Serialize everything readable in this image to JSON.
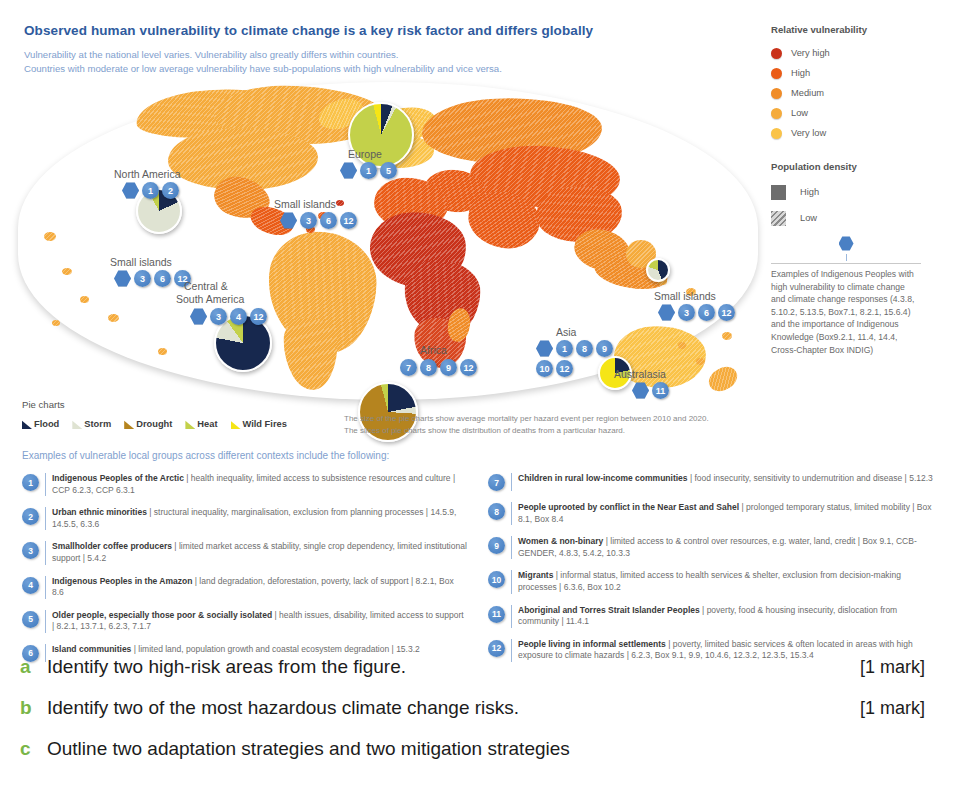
{
  "figure": {
    "title": "Observed human vulnerability to climate change is a key risk factor and differs globally",
    "subtitle_line1": "Vulnerability at the national level varies. Vulnerability also greatly differs within countries.",
    "subtitle_line2": "Countries with moderate or low average vulnerability have sub-populations with high vulnerability and vice versa."
  },
  "legend": {
    "vulnerability_title": "Relative vulnerability",
    "vulnerability_levels": [
      {
        "label": "Very high",
        "color": "#c9321a"
      },
      {
        "label": "High",
        "color": "#ea5c17"
      },
      {
        "label": "Medium",
        "color": "#f08c28"
      },
      {
        "label": "Low",
        "color": "#f5ab3c"
      },
      {
        "label": "Very low",
        "color": "#fac349"
      }
    ],
    "density_title": "Population density",
    "density_levels": [
      {
        "label": "High",
        "style": "solid"
      },
      {
        "label": "Low",
        "style": "hatched"
      }
    ]
  },
  "indigenous_note": {
    "icon": "hex-pin-icon",
    "text": "Examples of Indigenous Peoples with high vulnerability to climate change and climate change responses (4.3.8, 5.10.2, 5.13.5, Box7.1, 8.2.1, 15.6.4) and the importance of Indigenous Knowledge (Box9.2.1, 11.4, 14.4, Cross-Chapter Box INDIG)"
  },
  "pie_legend": {
    "title": "Pie charts",
    "hazards": [
      {
        "label": "Flood",
        "color": "#17284e"
      },
      {
        "label": "Storm",
        "color": "#dfe3d2"
      },
      {
        "label": "Drought",
        "color": "#b5841f"
      },
      {
        "label": "Heat",
        "color": "#c3d14a"
      },
      {
        "label": "Wild Fires",
        "color": "#f5e516"
      }
    ],
    "caption_line1": "The size of the pie charts show average mortality per hazard event per region between 2010 and 2020.",
    "caption_line2": "The slices of pie charts show the distribution of deaths from a particular hazard."
  },
  "map": {
    "regions": [
      {
        "name": "North America",
        "label": "North America",
        "badges": [
          "hex",
          "1",
          "2"
        ],
        "x": 96,
        "y": 86,
        "bx": 104,
        "by": 100
      },
      {
        "name": "Small islands Caribbean",
        "label": "Small islands",
        "badges": [
          "hex",
          "3",
          "6",
          "12"
        ],
        "x": 256,
        "y": 116,
        "bx": 262,
        "by": 130
      },
      {
        "name": "Small islands Pacific East",
        "label": "Small islands",
        "badges": [
          "hex",
          "3",
          "6",
          "12"
        ],
        "x": 92,
        "y": 174,
        "bx": 96,
        "by": 188
      },
      {
        "name": "Central and South America",
        "label": "Central &",
        "label2": "South America",
        "badges": [
          "hex",
          "3",
          "4",
          "12"
        ],
        "x": 166,
        "y": 198,
        "bx": 172,
        "by": 226
      },
      {
        "name": "Europe",
        "label": "Europe",
        "badges": [
          "hex",
          "1",
          "5"
        ],
        "x": 330,
        "y": 66,
        "bx": 322,
        "by": 80
      },
      {
        "name": "Africa",
        "label": "Africa",
        "badges": [
          "7",
          "8",
          "9",
          "12"
        ],
        "x": 402,
        "y": 262,
        "bx": 382,
        "by": 277
      },
      {
        "name": "Asia",
        "label": "Asia",
        "badges": [
          "hex",
          "1",
          "8",
          "9",
          "10",
          "12"
        ],
        "x": 538,
        "y": 244,
        "bx": 518,
        "by": 258
      },
      {
        "name": "Small islands Pacific West",
        "label": "Small islands",
        "badges": [
          "hex",
          "3",
          "6",
          "12"
        ],
        "x": 636,
        "y": 208,
        "bx": 640,
        "by": 222
      },
      {
        "name": "Australasia",
        "label": "Australasia",
        "badges": [
          "hex",
          "11"
        ],
        "x": 596,
        "y": 286,
        "bx": 614,
        "by": 300
      }
    ]
  },
  "chart_data": {
    "type": "pie",
    "hazards": [
      "Flood",
      "Storm",
      "Drought",
      "Heat",
      "Wild Fires"
    ],
    "colors": [
      "#17284e",
      "#dfe3d2",
      "#b5841f",
      "#c3d14a",
      "#f5e516"
    ],
    "pies": [
      {
        "region": "North America",
        "size_px": 46,
        "values": [
          18,
          74,
          0,
          8,
          0
        ]
      },
      {
        "region": "Central & South America",
        "size_px": 58,
        "values": [
          78,
          12,
          0,
          10,
          0
        ]
      },
      {
        "region": "Europe",
        "size_px": 66,
        "values": [
          6,
          2,
          0,
          88,
          4
        ]
      },
      {
        "region": "Africa",
        "size_px": 60,
        "values": [
          22,
          4,
          70,
          4,
          0
        ]
      },
      {
        "region": "Asia",
        "size_px": 24,
        "values": [
          44,
          36,
          0,
          20,
          0
        ]
      },
      {
        "region": "Australasia",
        "size_px": 34,
        "values": [
          22,
          0,
          0,
          10,
          68
        ]
      }
    ]
  },
  "examples": {
    "heading": "Examples of vulnerable local groups across different contexts include the following:",
    "left": [
      {
        "num": "1",
        "title": "Indigenous Peoples of the Arctic",
        "desc": "health inequality, limited access to subsistence resources and culture",
        "refs": "CCP 6.2.3, CCP 6.3.1"
      },
      {
        "num": "2",
        "title": "Urban ethnic minorities",
        "desc": "structural inequality, marginalisation, exclusion from planning processes",
        "refs": "14.5.9, 14.5.5, 6.3.6"
      },
      {
        "num": "3",
        "title": "Smallholder coffee producers",
        "desc": "limited market access & stability, single crop dependency, limited institutional support",
        "refs": "5.4.2"
      },
      {
        "num": "4",
        "title": "Indigenous Peoples in the Amazon",
        "desc": "land degradation, deforestation, poverty, lack of support",
        "refs": "8.2.1, Box 8.6"
      },
      {
        "num": "5",
        "title": "Older people, especially those poor & socially isolated",
        "desc": "health issues, disability, limited access to support",
        "refs": "8.2.1, 13.7.1, 6.2.3, 7.1.7"
      },
      {
        "num": "6",
        "title": "Island communities",
        "desc": "limited land, population growth and coastal ecosystem degradation",
        "refs": "15.3.2"
      }
    ],
    "right": [
      {
        "num": "7",
        "title": "Children in rural low-income communities",
        "desc": "food insecurity, sensitivity to undernutrition and disease",
        "refs": "5.12.3"
      },
      {
        "num": "8",
        "title": "People uprooted by conflict in the Near East and Sahel",
        "desc": "prolonged temporary status, limited mobility",
        "refs": "Box 8.1, Box 8.4"
      },
      {
        "num": "9",
        "title": "Women & non-binary",
        "desc": "limited access to & control over resources, e.g. water, land, credit",
        "refs": "Box 9.1, CCB-GENDER, 4.8.3, 5.4.2, 10.3.3"
      },
      {
        "num": "10",
        "title": "Migrants",
        "desc": "informal status, limited access to health services & shelter, exclusion from decision-making processes",
        "refs": "6.3.6, Box 10.2"
      },
      {
        "num": "11",
        "title": "Aboriginal and Torres Strait Islander Peoples",
        "desc": "poverty, food & housing insecurity, dislocation from community",
        "refs": "11.4.1"
      },
      {
        "num": "12",
        "title": "People living in informal settlements",
        "desc": "poverty, limited basic services & often located in areas with high exposure to climate hazards",
        "refs": "6.2.3, Box 9.1, 9.9, 10.4.6, 12.3.2, 12.3.5, 15.3.4"
      }
    ]
  },
  "questions": [
    {
      "letter": "a",
      "text": "Identify two high-risk areas from the figure.",
      "mark": "[1 mark]"
    },
    {
      "letter": "b",
      "text": "Identify two of the most hazardous climate change risks.",
      "mark": "[1 mark]"
    },
    {
      "letter": "c",
      "text": "Outline two adaptation strategies and two mitigation strategies",
      "mark": ""
    }
  ]
}
